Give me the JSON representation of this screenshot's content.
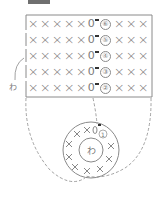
{
  "diagram": {
    "type": "crochet-chart",
    "colors": {
      "line": "#8a8a8a",
      "text": "#7a7a7a",
      "marker": "#333333",
      "top_bar": "#6f6f6f"
    },
    "side_label": "わ",
    "ring": {
      "center_label": "わ",
      "round_number": "①",
      "stitches": [
        "×",
        "×",
        "0",
        "×",
        "×",
        "×",
        "×",
        "×",
        "×",
        "×"
      ]
    },
    "rows": [
      {
        "number": "⑥",
        "before": [
          "×",
          "×",
          "×",
          "×",
          "×"
        ],
        "chain": "0",
        "after": [
          "×",
          "×",
          "×"
        ]
      },
      {
        "number": "⑤",
        "before": [
          "×",
          "×",
          "×",
          "×",
          "×"
        ],
        "chain": "0",
        "after": [
          "×",
          "×",
          "×"
        ]
      },
      {
        "number": "④",
        "before": [
          "×",
          "×",
          "×",
          "×",
          "×"
        ],
        "chain": "0",
        "after": [
          "×",
          "×",
          "×"
        ]
      },
      {
        "number": "③",
        "before": [
          "×",
          "×",
          "×",
          "×",
          "×"
        ],
        "chain": "0",
        "after": [
          "×",
          "×",
          "×"
        ]
      },
      {
        "number": "②",
        "before": [
          "×",
          "×",
          "×",
          "×",
          "×"
        ],
        "chain": "0",
        "after": [
          "×",
          "×",
          "×"
        ]
      }
    ],
    "row_labels": {
      "r6": "⑥",
      "r5": "⑤",
      "r4": "④",
      "r3": "③",
      "r2": "②"
    },
    "symbols": {
      "sc": "×",
      "ch": "0"
    }
  }
}
